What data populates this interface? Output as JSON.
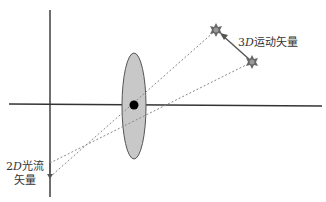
{
  "diagram": {
    "labels": {
      "motion_3d": {
        "prefix": "3",
        "italic": "D",
        "suffix": "运动矢量"
      },
      "flow_2d_line1": {
        "prefix": "2",
        "italic": "D",
        "suffix": "光流"
      },
      "flow_2d_line2": "矢量"
    },
    "colors": {
      "axis": "#333333",
      "lens_fill": "#c8c8c8",
      "lens_stroke": "#555555",
      "center": "#000000",
      "dashed": "#888888",
      "star": "#666666"
    }
  }
}
